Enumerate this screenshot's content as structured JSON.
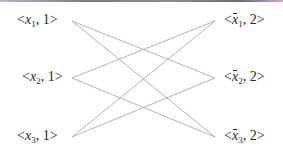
{
  "diagram": {
    "left_nodes": [
      {
        "open": "<",
        "var": "x",
        "sub": "1",
        "rest": ", 1>"
      },
      {
        "open": "<",
        "var": "x",
        "sub": "2",
        "rest": ", 1>"
      },
      {
        "open": "<",
        "var": "x",
        "sub": "3",
        "rest": ", 1>"
      }
    ],
    "right_nodes": [
      {
        "open": "<",
        "var": "x",
        "sub": "1",
        "rest": ", 2>",
        "negated": true
      },
      {
        "open": "<",
        "var": "x",
        "sub": "2",
        "rest": ", 2>",
        "negated": true
      },
      {
        "open": "<",
        "var": "x",
        "sub": "3",
        "rest": ", 2>",
        "negated": true
      }
    ],
    "edges": [
      {
        "from": "<x1, 1>",
        "to": "<x̄2, 2>"
      },
      {
        "from": "<x1, 1>",
        "to": "<x̄3, 2>"
      },
      {
        "from": "<x2, 1>",
        "to": "<x̄1, 2>"
      },
      {
        "from": "<x2, 1>",
        "to": "<x̄3, 2>"
      },
      {
        "from": "<x3, 1>",
        "to": "<x̄1, 2>"
      },
      {
        "from": "<x3, 1>",
        "to": "<x̄2, 2>"
      }
    ],
    "edge_color": "#b4b4b4",
    "text_color": "#2a2a2a"
  }
}
